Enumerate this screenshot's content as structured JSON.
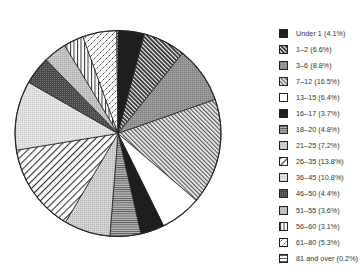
{
  "chart_data": {
    "type": "pie",
    "title": "",
    "start_angle_deg": 0,
    "direction": "clockwise",
    "legend_position": "right",
    "categories": [
      "Under 1",
      "1–2",
      "3–6",
      "7–12",
      "13–15",
      "16–17",
      "18–20",
      "21–25",
      "26–35",
      "36–45",
      "46–50",
      "51–55",
      "56–60",
      "61–80",
      "81 and over"
    ],
    "values": [
      4.1,
      6.6,
      8.8,
      16.5,
      6.4,
      3.7,
      4.8,
      7.2,
      13.8,
      10.8,
      4.4,
      3.6,
      3.1,
      5.3,
      0.2
    ],
    "labels": [
      "Under 1 (4.1%)",
      "1–2 (6.6%)",
      "3–6 (8.8%)",
      "7–12 (16.5%)",
      "13–15 (6.4%)",
      "16–17 (3.7%)",
      "18–20 (4.8%)",
      "21–25 (7.2%)",
      "26–35 (13.8%)",
      "36–45 (10.8%)",
      "46–50 (4.4%)",
      "51–55 (3.6%)",
      "56–60 (3.1%)",
      "61–80 (5.3%)",
      "81 and over (0.2%)"
    ],
    "patterns": [
      "solid-dark",
      "diag-dense-dark",
      "crosshatch-gray",
      "diag-dense-light",
      "white",
      "solid-dark",
      "horizontal-lines",
      "dotted-light-gray",
      "diag-sparse",
      "light-gray",
      "dark-gray-dotted",
      "light-gray-dotted",
      "vertical-lines",
      "diagonal-dashes",
      "horizontal-sparse"
    ]
  },
  "colors": {
    "background": "#ffffff",
    "outline": "#222222",
    "text": "#333333"
  }
}
